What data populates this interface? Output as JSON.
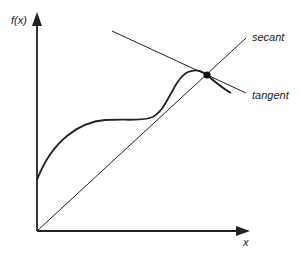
{
  "diagram": {
    "y_axis_label": "f(x)",
    "x_axis_label": "x",
    "secant_label": "secant",
    "tangent_label": "tangent",
    "colors": {
      "stroke": "#222222",
      "background": "#ffffff"
    }
  }
}
